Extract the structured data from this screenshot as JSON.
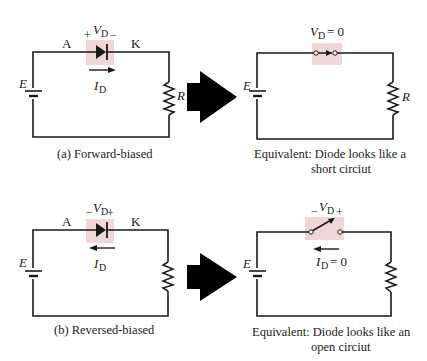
{
  "colors": {
    "wire": "#1a1a1a",
    "highlight": "#f0d6d8",
    "arrow": "#000000",
    "background": "#ffffff"
  },
  "panels": [
    {
      "id": "a",
      "caption": "(a) Forward-biased",
      "anode_label": "A",
      "cathode_label": "K",
      "voltage_symbol": "V",
      "voltage_subscript": "D",
      "left_polarity": "+",
      "right_polarity": "−",
      "current_symbol": "I",
      "current_subscript": "D",
      "current_direction": "right",
      "source_label": "E",
      "resistor_label": "R"
    },
    {
      "id": "a-equivalent",
      "caption_line1": "Equivalent: Diode looks like a",
      "caption_line2": "short circiut",
      "voltage_symbol": "V",
      "voltage_subscript": "D",
      "voltage_value": "= 0",
      "source_label": "E",
      "resistor_label": "R",
      "element": "closed-switch"
    },
    {
      "id": "b",
      "caption": "(b) Reversed-biased",
      "anode_label": "A",
      "cathode_label": "K",
      "voltage_symbol": "V",
      "voltage_subscript": "D",
      "left_polarity": "−",
      "right_polarity": "+",
      "current_symbol": "I",
      "current_subscript": "D",
      "current_direction": "left",
      "source_label": "E"
    },
    {
      "id": "b-equivalent",
      "caption_line1": "Equivalent: Diode looks like an",
      "caption_line2": "open circiut",
      "voltage_symbol": "V",
      "voltage_subscript": "D",
      "left_polarity": "−",
      "right_polarity": "+",
      "current_symbol": "I",
      "current_subscript": "D",
      "current_value": "= 0",
      "source_label": "E",
      "element": "open-switch"
    }
  ],
  "transition_arrows": [
    {
      "from": "a",
      "to": "a-equivalent",
      "icon": "big-right-arrow-icon"
    },
    {
      "from": "b",
      "to": "b-equivalent",
      "icon": "big-right-arrow-icon"
    }
  ]
}
